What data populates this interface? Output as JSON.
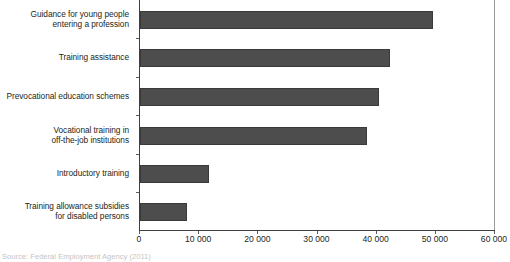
{
  "chart_data": {
    "type": "bar",
    "orientation": "horizontal",
    "title": "",
    "xlabel": "",
    "ylabel": "",
    "xlim": [
      0,
      60000
    ],
    "xticks": [
      0,
      10000,
      20000,
      30000,
      40000,
      50000,
      60000
    ],
    "xtick_labels": [
      "0",
      "10 000",
      "20 000",
      "30 000",
      "40 000",
      "50 000",
      "60 000"
    ],
    "grid": false,
    "legend": null,
    "bar_color": "#4d4d4d",
    "axis_color": "#3f3f3f",
    "categories": [
      "Guidance for young people entering a profession",
      "Training assistance",
      "Prevocational education schemes",
      "Vocational training in off-the-job institutions",
      "Introductory training",
      "Training allowance subsidies for disabled persons"
    ],
    "category_lines": [
      [
        "Guidance for young people",
        "entering a profession"
      ],
      [
        "Training assistance"
      ],
      [
        "Prevocational education schemes"
      ],
      [
        "Vocational training in",
        "off-the-job institutions"
      ],
      [
        "Introductory training"
      ],
      [
        "Training allowance subsidies",
        "for disabled persons"
      ]
    ],
    "values": [
      49500,
      42300,
      40400,
      38300,
      11600,
      8000
    ]
  },
  "source": {
    "caption": "Source: Federal Employment Agency (2011)"
  }
}
